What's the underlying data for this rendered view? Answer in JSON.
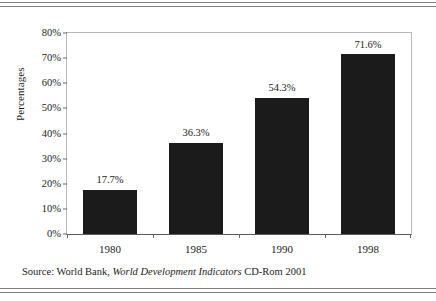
{
  "chart_data": {
    "type": "bar",
    "title": "",
    "subtitle": "",
    "categories": [
      "1980",
      "1985",
      "1990",
      "1998"
    ],
    "values": [
      17.7,
      36.3,
      54.3,
      71.6
    ],
    "value_labels": [
      "17.7%",
      "36.3%",
      "54.3%",
      "71.6%"
    ],
    "series": [
      {
        "name": "Percentages",
        "values": [
          17.7,
          36.3,
          54.3,
          71.6
        ]
      }
    ],
    "xlabel": "",
    "ylabel": "Percentages",
    "ylim": [
      0,
      80
    ],
    "ytick_values": [
      0,
      10,
      20,
      30,
      40,
      50,
      60,
      70,
      80
    ],
    "ytick_labels": [
      "0%",
      "10%",
      "20%",
      "30%",
      "40%",
      "50%",
      "60%",
      "70%",
      "80%"
    ],
    "grid": false,
    "legend": false,
    "legend_position": "none",
    "bar_color": "#1b1b1b",
    "axis_color": "#5a5a5a",
    "frame_color": "#b8b8b8",
    "text_color": "#1c1c1c"
  },
  "source_note": {
    "prefix": "Source: World Bank, ",
    "italic": "World Development Indicators",
    "suffix": " CD-Rom 2001",
    "full": "Source: World Bank, World Development Indicators CD-Rom 2001"
  },
  "rules": {
    "top_count": 2,
    "bottom_count": 2,
    "color": "#808080"
  }
}
